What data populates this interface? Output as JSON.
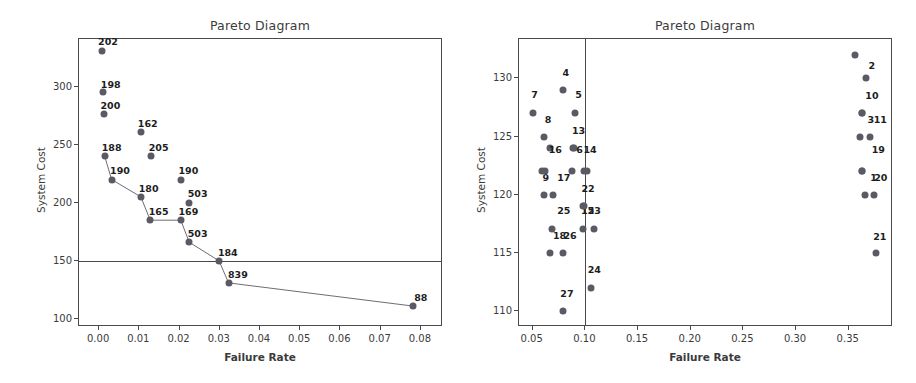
{
  "figure": {
    "width": 916,
    "height": 383,
    "background": "#ffffff",
    "marker_color": "#5a5a64",
    "axis_color": "#4a4a4a",
    "label_color": "#1d1d1d"
  },
  "chart_data": [
    {
      "type": "scatter",
      "panel": "left",
      "title": "Pareto Diagram",
      "xlabel": "Failure Rate",
      "ylabel": "System Cost",
      "xlim": [
        -0.005,
        0.0855
      ],
      "ylim": [
        93,
        341
      ],
      "xticks": [
        "0.00",
        "0.01",
        "0.02",
        "0.03",
        "0.04",
        "0.05",
        "0.06",
        "0.07",
        "0.08"
      ],
      "xtick_values": [
        0.0,
        0.01,
        0.02,
        0.03,
        0.04,
        0.05,
        0.06,
        0.07,
        0.08
      ],
      "yticks": [
        "100",
        "150",
        "200",
        "250",
        "300"
      ],
      "ytick_values": [
        100,
        150,
        200,
        250,
        300
      ],
      "grid": false,
      "legend": "none",
      "threshold_line": {
        "axis": "horizontal",
        "value": 150
      },
      "points": [
        {
          "x": 0.0006,
          "y": 331,
          "label": "202",
          "lx": 0.0022,
          "ly": 339
        },
        {
          "x": 0.001,
          "y": 295,
          "label": "198",
          "lx": 0.0029,
          "ly": 302
        },
        {
          "x": 0.0012,
          "y": 276,
          "label": "200",
          "lx": 0.0028,
          "ly": 284
        },
        {
          "x": 0.0104,
          "y": 261,
          "label": "162",
          "lx": 0.0121,
          "ly": 269
        },
        {
          "x": 0.0014,
          "y": 240,
          "label": "188",
          "lx": 0.0031,
          "ly": 248
        },
        {
          "x": 0.0128,
          "y": 240,
          "label": "205",
          "lx": 0.0148,
          "ly": 248
        },
        {
          "x": 0.0031,
          "y": 220,
          "label": "190",
          "lx": 0.0052,
          "ly": 228
        },
        {
          "x": 0.0203,
          "y": 220,
          "label": "190",
          "lx": 0.0222,
          "ly": 228
        },
        {
          "x": 0.0104,
          "y": 205,
          "label": "180",
          "lx": 0.0123,
          "ly": 213
        },
        {
          "x": 0.0224,
          "y": 200,
          "label": "503",
          "lx": 0.0245,
          "ly": 208
        },
        {
          "x": 0.0127,
          "y": 185,
          "label": "165",
          "lx": 0.0148,
          "ly": 193
        },
        {
          "x": 0.0203,
          "y": 185,
          "label": "169",
          "lx": 0.0222,
          "ly": 193
        },
        {
          "x": 0.0224,
          "y": 166,
          "label": "503",
          "lx": 0.0245,
          "ly": 174
        },
        {
          "x": 0.0298,
          "y": 150,
          "label": "184",
          "lx": 0.032,
          "ly": 158
        },
        {
          "x": 0.0322,
          "y": 131,
          "label": "839",
          "lx": 0.0345,
          "ly": 139
        },
        {
          "x": 0.0781,
          "y": 111,
          "label": "88",
          "lx": 0.08,
          "ly": 119
        }
      ],
      "pareto_path": [
        {
          "x": 0.0014,
          "y": 240
        },
        {
          "x": 0.0031,
          "y": 220
        },
        {
          "x": 0.0104,
          "y": 205
        },
        {
          "x": 0.0127,
          "y": 185
        },
        {
          "x": 0.0203,
          "y": 185
        },
        {
          "x": 0.0224,
          "y": 166
        },
        {
          "x": 0.0298,
          "y": 150
        },
        {
          "x": 0.0322,
          "y": 131
        },
        {
          "x": 0.0781,
          "y": 111
        }
      ]
    },
    {
      "type": "scatter",
      "panel": "right",
      "title": "Pareto Diagram",
      "xlabel": "Failure Rate",
      "ylabel": "System Cost",
      "xlim": [
        0.037,
        0.392
      ],
      "ylim": [
        108.6,
        133.4
      ],
      "xticks": [
        "0.05",
        "0.10",
        "0.15",
        "0.20",
        "0.25",
        "0.30",
        "0.35"
      ],
      "xtick_values": [
        0.05,
        0.1,
        0.15,
        0.2,
        0.25,
        0.3,
        0.35
      ],
      "yticks": [
        "110",
        "115",
        "120",
        "125",
        "130"
      ],
      "ytick_values": [
        110,
        115,
        120,
        125,
        130
      ],
      "grid": false,
      "legend": "none",
      "threshold_line": {
        "axis": "vertical",
        "value": 0.1
      },
      "points": [
        {
          "x": 0.356,
          "y": 132,
          "label": "2",
          "lx": 0.372,
          "ly": 131.2
        },
        {
          "x": 0.079,
          "y": 129,
          "label": "4",
          "lx": 0.0815,
          "ly": 130.6
        },
        {
          "x": 0.366,
          "y": 130,
          "label": "10",
          "lx": 0.372,
          "ly": 128.6
        },
        {
          "x": 0.05,
          "y": 127,
          "label": "7",
          "lx": 0.0518,
          "ly": 128.7
        },
        {
          "x": 0.09,
          "y": 127,
          "label": "5",
          "lx": 0.0935,
          "ly": 128.7
        },
        {
          "x": 0.363,
          "y": 127,
          "label": "3",
          "lx": 0.371,
          "ly": 126.5
        },
        {
          "x": 0.363,
          "y": 127,
          "label": "11",
          "lx": 0.38,
          "ly": 126.5
        },
        {
          "x": 0.061,
          "y": 125,
          "label": "8",
          "lx": 0.0646,
          "ly": 126.5
        },
        {
          "x": 0.361,
          "y": 125,
          "label": "19",
          "lx": 0.378,
          "ly": 123.9
        },
        {
          "x": 0.37,
          "y": 125,
          "label": "",
          "lx": 0.37,
          "ly": 125
        },
        {
          "x": 0.0885,
          "y": 124,
          "label": "13",
          "lx": 0.0935,
          "ly": 125.6
        },
        {
          "x": 0.0895,
          "y": 124,
          "label": "6",
          "lx": 0.0945,
          "ly": 123.9
        },
        {
          "x": 0.0665,
          "y": 124,
          "label": "16",
          "lx": 0.0715,
          "ly": 123.9
        },
        {
          "x": 0.102,
          "y": 122,
          "label": "14",
          "lx": 0.1045,
          "ly": 123.9
        },
        {
          "x": 0.059,
          "y": 122,
          "label": "9",
          "lx": 0.0625,
          "ly": 121.5
        },
        {
          "x": 0.0615,
          "y": 122,
          "label": "",
          "lx": 0.0615,
          "ly": 122
        },
        {
          "x": 0.0875,
          "y": 122,
          "label": "17",
          "lx": 0.0795,
          "ly": 121.5
        },
        {
          "x": 0.0985,
          "y": 122,
          "label": "22",
          "lx": 0.1025,
          "ly": 120.6
        },
        {
          "x": 0.363,
          "y": 122,
          "label": "1",
          "lx": 0.3735,
          "ly": 121.5
        },
        {
          "x": 0.363,
          "y": 122,
          "label": "20",
          "lx": 0.3805,
          "ly": 121.5
        },
        {
          "x": 0.061,
          "y": 120,
          "label": "",
          "lx": 0.061,
          "ly": 120
        },
        {
          "x": 0.0695,
          "y": 120,
          "label": "25",
          "lx": 0.0795,
          "ly": 118.7
        },
        {
          "x": 0.365,
          "y": 120,
          "label": "",
          "lx": 0.365,
          "ly": 120
        },
        {
          "x": 0.374,
          "y": 120,
          "label": "",
          "lx": 0.374,
          "ly": 120
        },
        {
          "x": 0.0975,
          "y": 119,
          "label": "15",
          "lx": 0.1022,
          "ly": 118.7
        },
        {
          "x": 0.0985,
          "y": 119,
          "label": "23",
          "lx": 0.1085,
          "ly": 118.7
        },
        {
          "x": 0.068,
          "y": 117,
          "label": "18",
          "lx": 0.0755,
          "ly": 116.5
        },
        {
          "x": 0.0975,
          "y": 117,
          "label": "26",
          "lx": 0.0855,
          "ly": 116.5
        },
        {
          "x": 0.1085,
          "y": 117,
          "label": "",
          "lx": 0.1085,
          "ly": 117
        },
        {
          "x": 0.0665,
          "y": 115,
          "label": "",
          "lx": 0.0665,
          "ly": 115
        },
        {
          "x": 0.0785,
          "y": 115,
          "label": "",
          "lx": 0.0785,
          "ly": 115
        },
        {
          "x": 0.3755,
          "y": 115,
          "label": "21",
          "lx": 0.3795,
          "ly": 116.4
        },
        {
          "x": 0.1055,
          "y": 112,
          "label": "24",
          "lx": 0.1085,
          "ly": 113.6
        },
        {
          "x": 0.0785,
          "y": 110,
          "label": "27",
          "lx": 0.0825,
          "ly": 111.5
        }
      ]
    }
  ]
}
